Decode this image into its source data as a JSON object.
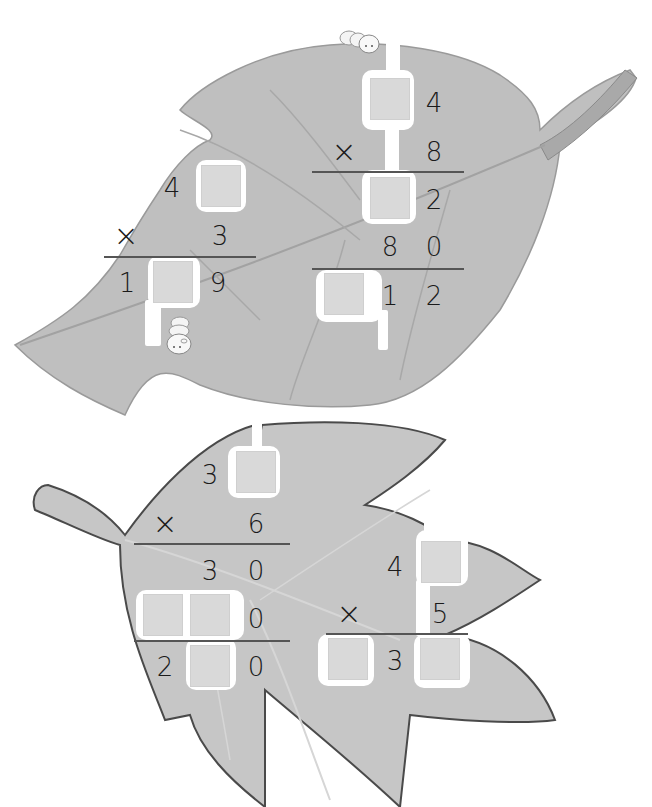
{
  "colors": {
    "leaf_fill": "#bdbdbd",
    "leaf_fill_light": "#c8c8c8",
    "leaf_outline": "#4a4a4a",
    "vein": "#a6a6a6",
    "box_fill": "#d9d9d9",
    "digit": "#1a1a1a",
    "cutout": "#ffffff"
  },
  "icons": {
    "caterpillar_top": "caterpillar-icon",
    "caterpillar_left": "caterpillar-icon"
  },
  "problems": [
    {
      "id": "top-leaf-left",
      "rows": [
        {
          "cells": [
            "",
            "4",
            "[ ]"
          ]
        },
        {
          "operator": "×",
          "cells": [
            "",
            "",
            "3"
          ]
        },
        {
          "cells": [
            "1",
            "[ ]",
            "9"
          ]
        }
      ],
      "labels": {
        "d1": "4",
        "op": "×",
        "d2": "3",
        "r1": "1",
        "r3": "9"
      }
    },
    {
      "id": "top-leaf-right",
      "rows": [
        {
          "cells": [
            "",
            "[ ]",
            "4"
          ]
        },
        {
          "operator": "×",
          "cells": [
            "",
            "",
            "8"
          ]
        },
        {
          "cells": [
            "",
            "[ ]",
            "2"
          ]
        },
        {
          "cells": [
            "",
            "8",
            "0"
          ]
        },
        {
          "cells": [
            "[ ]",
            "1",
            "2"
          ]
        }
      ],
      "labels": {
        "d1": "4",
        "op": "×",
        "d2": "8",
        "p1": "2",
        "p2a": "8",
        "p2b": "0",
        "s2": "1",
        "s3": "2"
      }
    },
    {
      "id": "bottom-leaf-left",
      "rows": [
        {
          "cells": [
            "",
            "3",
            "[ ]"
          ]
        },
        {
          "operator": "×",
          "cells": [
            "",
            "",
            "6"
          ]
        },
        {
          "cells": [
            "",
            "3",
            "0"
          ]
        },
        {
          "cells": [
            "[ ]",
            "[ ]",
            "0"
          ]
        },
        {
          "cells": [
            "2",
            "[ ]",
            "0"
          ]
        }
      ],
      "labels": {
        "d1": "3",
        "op": "×",
        "d2": "6",
        "p1a": "3",
        "p1b": "0",
        "p2": "0",
        "s1": "2",
        "s3": "0"
      }
    },
    {
      "id": "bottom-leaf-right",
      "rows": [
        {
          "cells": [
            "",
            "4",
            "[ ]"
          ]
        },
        {
          "operator": "×",
          "cells": [
            "",
            "",
            "5"
          ]
        },
        {
          "cells": [
            "[ ]",
            "3",
            "[ ]"
          ]
        }
      ],
      "labels": {
        "d1": "4",
        "op": "×",
        "d2": "5",
        "r2": "3"
      }
    }
  ]
}
